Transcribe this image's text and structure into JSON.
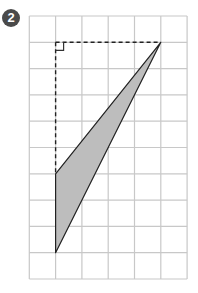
{
  "problem": {
    "number": "2"
  },
  "grid": {
    "columns": 6,
    "rows": 10,
    "origin_x": 29.3,
    "origin_y": 16,
    "cell": 26.3,
    "line_color": "#c8c8c8"
  },
  "triangle": {
    "vertices_grid": [
      [
        5,
        1
      ],
      [
        1,
        6
      ],
      [
        1,
        9
      ]
    ],
    "fill": "#bdbdbd",
    "stroke": "#222222"
  },
  "dashed_lines": [
    {
      "from": [
        1,
        1
      ],
      "to": [
        5,
        1
      ]
    },
    {
      "from": [
        1,
        1
      ],
      "to": [
        1,
        6
      ]
    }
  ],
  "right_angle_marker": {
    "corner": [
      1,
      1
    ],
    "size": 8
  }
}
